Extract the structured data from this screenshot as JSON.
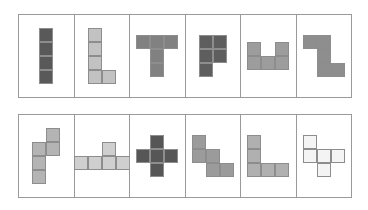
{
  "layout": {
    "rows": 2,
    "columns": 6,
    "cell_size_px": 14,
    "panel_border_color": "#9a9a9a",
    "square_border_color": "#8d8d8d",
    "background_color": "#ffffff"
  },
  "tiles": [
    {
      "id": "tile-1",
      "name": "I-tetromino",
      "row": 1,
      "column": 1,
      "cell_count": 4,
      "fill": "#595959",
      "cells": [
        [
          0,
          0
        ],
        [
          1,
          0
        ],
        [
          2,
          0
        ],
        [
          3,
          0
        ]
      ]
    },
    {
      "id": "tile-2",
      "name": "L-pentomino",
      "row": 1,
      "column": 2,
      "cell_count": 5,
      "fill": "#c2c2c2",
      "cells": [
        [
          0,
          0
        ],
        [
          1,
          0
        ],
        [
          2,
          0
        ],
        [
          3,
          0
        ],
        [
          3,
          1
        ]
      ]
    },
    {
      "id": "tile-3",
      "name": "T-pentomino",
      "row": 1,
      "column": 3,
      "cell_count": 5,
      "fill": "#818181",
      "cells": [
        [
          0,
          0
        ],
        [
          0,
          1
        ],
        [
          0,
          2
        ],
        [
          1,
          1
        ],
        [
          2,
          1
        ]
      ]
    },
    {
      "id": "tile-4",
      "name": "P-pentomino",
      "row": 1,
      "column": 4,
      "cell_count": 5,
      "fill": "#5e5e5e",
      "cells": [
        [
          0,
          0
        ],
        [
          0,
          1
        ],
        [
          1,
          0
        ],
        [
          1,
          1
        ],
        [
          2,
          0
        ]
      ]
    },
    {
      "id": "tile-5",
      "name": "U-pentomino",
      "row": 1,
      "column": 5,
      "cell_count": 5,
      "fill": "#9d9d9d",
      "cells": [
        [
          0,
          0
        ],
        [
          0,
          2
        ],
        [
          1,
          0
        ],
        [
          1,
          1
        ],
        [
          1,
          2
        ]
      ]
    },
    {
      "id": "tile-6",
      "name": "N-pentomino",
      "row": 1,
      "column": 6,
      "cell_count": 5,
      "fill": "#8e8e8e",
      "cells": [
        [
          0,
          0
        ],
        [
          0,
          1
        ],
        [
          1,
          1
        ],
        [
          2,
          1
        ],
        [
          2,
          2
        ]
      ]
    },
    {
      "id": "tile-7",
      "name": "N-pentomino-vertical",
      "row": 2,
      "column": 1,
      "cell_count": 5,
      "fill": "#b4b4b4",
      "cells": [
        [
          0,
          1
        ],
        [
          1,
          0
        ],
        [
          1,
          1
        ],
        [
          2,
          0
        ],
        [
          3,
          0
        ]
      ]
    },
    {
      "id": "tile-8",
      "name": "Y-pentomino",
      "row": 2,
      "column": 2,
      "cell_count": 5,
      "fill": "#cfcfcf",
      "cells": [
        [
          0,
          2
        ],
        [
          1,
          0
        ],
        [
          1,
          1
        ],
        [
          1,
          2
        ],
        [
          1,
          3
        ]
      ]
    },
    {
      "id": "tile-9",
      "name": "X-pentomino-plus",
      "row": 2,
      "column": 3,
      "cell_count": 5,
      "fill": "#565656",
      "cells": [
        [
          0,
          1
        ],
        [
          1,
          0
        ],
        [
          1,
          1
        ],
        [
          1,
          2
        ],
        [
          2,
          1
        ]
      ]
    },
    {
      "id": "tile-10",
      "name": "W-pentomino-staircase",
      "row": 2,
      "column": 4,
      "cell_count": 5,
      "fill": "#9b9b9b",
      "cells": [
        [
          0,
          0
        ],
        [
          1,
          0
        ],
        [
          1,
          1
        ],
        [
          2,
          1
        ],
        [
          2,
          2
        ]
      ]
    },
    {
      "id": "tile-11",
      "name": "V-pentomino",
      "row": 2,
      "column": 5,
      "cell_count": 5,
      "fill": "#b0b0b0",
      "cells": [
        [
          0,
          0
        ],
        [
          1,
          0
        ],
        [
          2,
          0
        ],
        [
          2,
          1
        ],
        [
          2,
          2
        ]
      ]
    },
    {
      "id": "tile-12",
      "name": "F-pentomino-outline",
      "row": 2,
      "column": 6,
      "cell_count": 5,
      "fill": "#f4f4f4",
      "cells": [
        [
          0,
          0
        ],
        [
          1,
          0
        ],
        [
          1,
          1
        ],
        [
          1,
          2
        ],
        [
          2,
          1
        ]
      ]
    }
  ]
}
